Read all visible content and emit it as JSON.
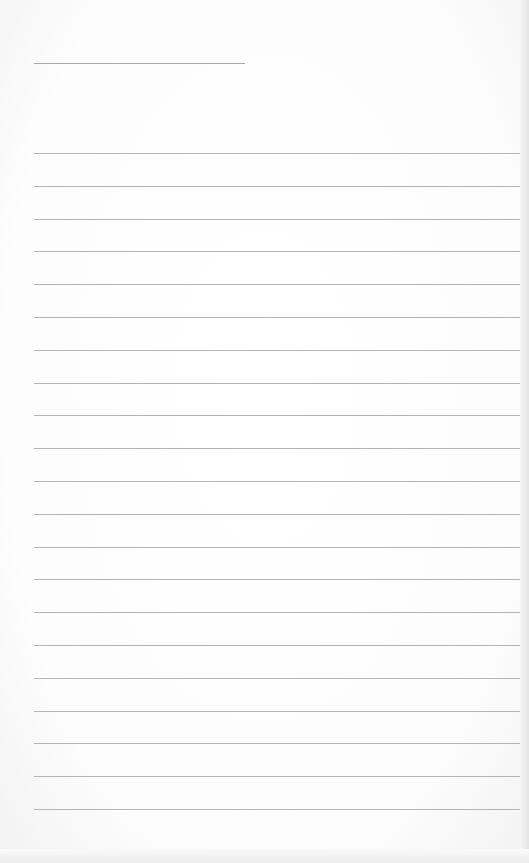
{
  "page": {
    "type": "blank lined notepaper",
    "title_line": {
      "text": ""
    },
    "ruled_lines": [
      {
        "text": ""
      },
      {
        "text": ""
      },
      {
        "text": ""
      },
      {
        "text": ""
      },
      {
        "text": ""
      },
      {
        "text": ""
      },
      {
        "text": ""
      },
      {
        "text": ""
      },
      {
        "text": ""
      },
      {
        "text": ""
      },
      {
        "text": ""
      },
      {
        "text": ""
      },
      {
        "text": ""
      },
      {
        "text": ""
      },
      {
        "text": ""
      },
      {
        "text": ""
      },
      {
        "text": ""
      },
      {
        "text": ""
      },
      {
        "text": ""
      },
      {
        "text": ""
      },
      {
        "text": ""
      }
    ],
    "colors": {
      "paper": "#ffffff",
      "line": "#b4b4b4"
    }
  }
}
